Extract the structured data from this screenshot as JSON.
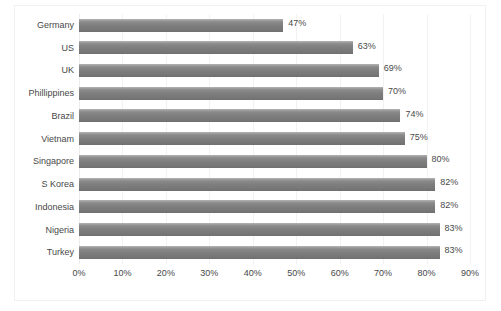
{
  "chart_data": {
    "type": "bar",
    "orientation": "horizontal",
    "title": "",
    "subtitle": "",
    "xlabel": "",
    "ylabel": "",
    "categories": [
      "Germany",
      "US",
      "UK",
      "Phillippines",
      "Brazil",
      "Vietnam",
      "Singapore",
      "S Korea",
      "Indonesia",
      "Nigeria",
      "Turkey"
    ],
    "values": [
      47,
      63,
      69,
      70,
      74,
      75,
      80,
      82,
      82,
      83,
      83
    ],
    "data_labels": [
      "47%",
      "63%",
      "69%",
      "70%",
      "74%",
      "75%",
      "80%",
      "82%",
      "82%",
      "83%",
      "83%"
    ],
    "xlim": [
      0,
      90
    ],
    "xticks": [
      0,
      10,
      20,
      30,
      40,
      50,
      60,
      70,
      80,
      90
    ],
    "xtick_labels": [
      "0%",
      "10%",
      "20%",
      "30%",
      "40%",
      "50%",
      "60%",
      "70%",
      "80%",
      "90%"
    ],
    "grid": "vertical",
    "legend": "none",
    "series_color": "#7d7d7d",
    "text_color": "#484848",
    "gridline_color": "#f2f2f2",
    "background_color": "#ffffff",
    "border_color": "#f1f1f1"
  }
}
